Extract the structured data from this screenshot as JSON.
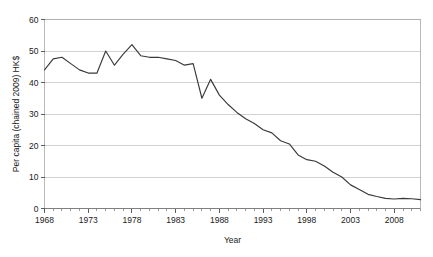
{
  "figure": {
    "cropped_title_fragment": "",
    "background_color": "#ffffff",
    "line_color": "#3a3a3a",
    "grid_color": "#bfbfbf",
    "axis_color": "#808080"
  },
  "chart_data": {
    "type": "line",
    "title": "",
    "xlabel": "Year",
    "ylabel": "Per capita (chained 2009) HK$",
    "xlim": [
      1968,
      2011
    ],
    "ylim": [
      0,
      60
    ],
    "yticks": [
      0,
      10,
      20,
      30,
      40,
      50,
      60
    ],
    "ytick_labels": [
      "0",
      "10",
      "20",
      "30",
      "40",
      "50",
      "60"
    ],
    "xticks": [
      1968,
      1973,
      1978,
      1983,
      1988,
      1993,
      1998,
      2003,
      2008
    ],
    "xtick_labels": [
      "1968",
      "1973",
      "1978",
      "1983",
      "1988",
      "1993",
      "1998",
      "2003",
      "2008"
    ],
    "minor_xtick_interval": 1,
    "grid": "horizontal",
    "legend": "none",
    "x": [
      1968,
      1969,
      1970,
      1971,
      1972,
      1973,
      1974,
      1975,
      1976,
      1977,
      1978,
      1979,
      1980,
      1981,
      1982,
      1983,
      1984,
      1985,
      1986,
      1987,
      1988,
      1989,
      1990,
      1991,
      1992,
      1993,
      1994,
      1995,
      1996,
      1997,
      1998,
      1999,
      2000,
      2001,
      2002,
      2003,
      2004,
      2005,
      2006,
      2007,
      2008,
      2009,
      2010,
      2011
    ],
    "values": [
      44.0,
      47.5,
      48.0,
      46.0,
      44.0,
      43.0,
      43.0,
      50.0,
      45.5,
      49.0,
      52.0,
      48.5,
      48.0,
      48.0,
      47.5,
      47.0,
      45.5,
      46.0,
      35.0,
      41.0,
      36.0,
      33.0,
      30.5,
      28.5,
      27.0,
      25.0,
      24.0,
      21.5,
      20.5,
      17.0,
      15.5,
      15.0,
      13.5,
      11.5,
      10.0,
      7.5,
      6.0,
      4.5,
      3.8,
      3.2,
      3.0,
      3.2,
      3.1,
      2.8
    ],
    "series": [
      {
        "name": "Per capita (chained 2009) HK$",
        "values": [
          44.0,
          47.5,
          48.0,
          46.0,
          44.0,
          43.0,
          43.0,
          50.0,
          45.5,
          49.0,
          52.0,
          48.5,
          48.0,
          48.0,
          47.5,
          47.0,
          45.5,
          46.0,
          35.0,
          41.0,
          36.0,
          33.0,
          30.5,
          28.5,
          27.0,
          25.0,
          24.0,
          21.5,
          20.5,
          17.0,
          15.5,
          15.0,
          13.5,
          11.5,
          10.0,
          7.5,
          6.0,
          4.5,
          3.8,
          3.2,
          3.0,
          3.2,
          3.1,
          2.8
        ]
      }
    ]
  }
}
